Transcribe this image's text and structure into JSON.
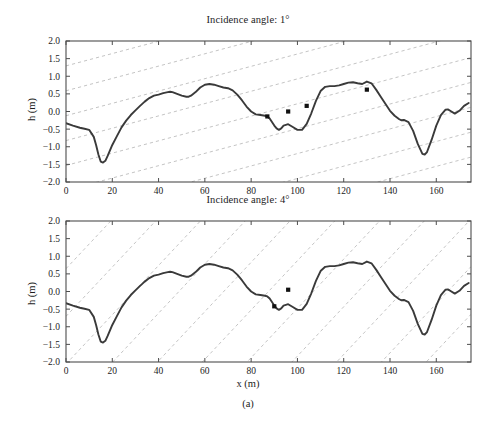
{
  "figure": {
    "subcaption": "(a)",
    "xlabel": "x (m)",
    "ylabel": "h (m)"
  },
  "style": {
    "curve_color": "#3a3a3a",
    "ray_color": "#bdbdbd",
    "axis_color": "#4d4d4d",
    "marker_color": "#111111",
    "background": "#ffffff"
  },
  "panels": [
    {
      "title": "Incidence angle: 1°"
    },
    {
      "title": "Incidence angle: 4°"
    }
  ],
  "chart_data": [
    {
      "type": "line",
      "title": "Incidence angle: 1°",
      "xlabel": "x (m)",
      "ylabel": "h (m)",
      "xlim": [
        0,
        175
      ],
      "ylim": [
        -2.0,
        2.0
      ],
      "xticks": [
        0,
        20,
        40,
        60,
        80,
        100,
        120,
        140,
        160
      ],
      "yticks": [
        -2.0,
        -1.5,
        -1.0,
        -0.5,
        0.0,
        0.5,
        1.0,
        1.5,
        2.0
      ],
      "ytick_labels": [
        "-2.0",
        "-1.5",
        "-1.0",
        "-0.5",
        "0.0",
        "0.5",
        "1.0",
        "1.5",
        "2.0"
      ],
      "grid": false,
      "series": [
        {
          "name": "terrain profile",
          "x": [
            0,
            3,
            6,
            8,
            10,
            12,
            13,
            14,
            15,
            16,
            17,
            18,
            20,
            22,
            24,
            26,
            28,
            30,
            32,
            34,
            36,
            38,
            40,
            42,
            44,
            45,
            46,
            48,
            50,
            52,
            53,
            54,
            56,
            58,
            60,
            62,
            64,
            66,
            68,
            70,
            72,
            74,
            76,
            78,
            80,
            82,
            84,
            86,
            87,
            88,
            90,
            91,
            92,
            93,
            94,
            96,
            98,
            100,
            102,
            104,
            106,
            108,
            110,
            112,
            114,
            116,
            118,
            120,
            122,
            124,
            126,
            128,
            130,
            132,
            134,
            136,
            138,
            140,
            142,
            144,
            145,
            146,
            148,
            150,
            152,
            154,
            155,
            156,
            158,
            160,
            162,
            164,
            165,
            166,
            168,
            170,
            172,
            174
          ],
          "y": [
            -0.33,
            -0.4,
            -0.46,
            -0.49,
            -0.52,
            -0.72,
            -0.95,
            -1.22,
            -1.42,
            -1.45,
            -1.4,
            -1.26,
            -0.95,
            -0.7,
            -0.45,
            -0.26,
            -0.1,
            0.03,
            0.16,
            0.28,
            0.38,
            0.45,
            0.48,
            0.52,
            0.55,
            0.56,
            0.55,
            0.5,
            0.45,
            0.42,
            0.42,
            0.45,
            0.55,
            0.68,
            0.76,
            0.78,
            0.76,
            0.72,
            0.68,
            0.66,
            0.6,
            0.48,
            0.32,
            0.14,
            0.0,
            -0.08,
            -0.1,
            -0.12,
            -0.14,
            -0.2,
            -0.4,
            -0.48,
            -0.52,
            -0.48,
            -0.4,
            -0.36,
            -0.44,
            -0.52,
            -0.52,
            -0.35,
            -0.05,
            0.3,
            0.58,
            0.7,
            0.72,
            0.72,
            0.74,
            0.78,
            0.82,
            0.83,
            0.8,
            0.78,
            0.85,
            0.8,
            0.62,
            0.42,
            0.22,
            0.02,
            -0.12,
            -0.22,
            -0.25,
            -0.24,
            -0.3,
            -0.55,
            -0.92,
            -1.2,
            -1.22,
            -1.15,
            -0.8,
            -0.4,
            -0.1,
            0.05,
            0.06,
            0.02,
            -0.06,
            0.02,
            0.16,
            0.24
          ]
        }
      ],
      "markers": [
        {
          "x": 87,
          "y": -0.14
        },
        {
          "x": 96,
          "y": 0.0
        },
        {
          "x": 104,
          "y": 0.16
        },
        {
          "x": 130,
          "y": 0.62
        }
      ],
      "rays": {
        "description": "family of parallel dashed incidence rays",
        "angle_deg": 1,
        "slope_rise_per_m": 0.0175,
        "count": 10,
        "style": "dashed"
      }
    },
    {
      "type": "line",
      "title": "Incidence angle: 4°",
      "xlabel": "x (m)",
      "ylabel": "h (m)",
      "xlim": [
        0,
        175
      ],
      "ylim": [
        -2.0,
        2.0
      ],
      "xticks": [
        0,
        20,
        40,
        60,
        80,
        100,
        120,
        140,
        160
      ],
      "yticks": [
        -2.0,
        -1.5,
        -1.0,
        -0.5,
        0.0,
        0.5,
        1.0,
        1.5,
        2.0
      ],
      "ytick_labels": [
        "-2.0",
        "-1.5",
        "-1.0",
        "-0.5",
        "0.0",
        "0.5",
        "1.0",
        "1.5",
        "2.0"
      ],
      "grid": false,
      "series": [
        {
          "name": "terrain profile",
          "x": [
            0,
            3,
            6,
            8,
            10,
            12,
            13,
            14,
            15,
            16,
            17,
            18,
            20,
            22,
            24,
            26,
            28,
            30,
            32,
            34,
            36,
            38,
            40,
            42,
            44,
            45,
            46,
            48,
            50,
            52,
            53,
            54,
            56,
            58,
            60,
            62,
            64,
            66,
            68,
            70,
            72,
            74,
            76,
            78,
            80,
            82,
            84,
            86,
            87,
            88,
            90,
            91,
            92,
            93,
            94,
            96,
            98,
            100,
            102,
            104,
            106,
            108,
            110,
            112,
            114,
            116,
            118,
            120,
            122,
            124,
            126,
            128,
            130,
            132,
            134,
            136,
            138,
            140,
            142,
            144,
            145,
            146,
            148,
            150,
            152,
            154,
            155,
            156,
            158,
            160,
            162,
            164,
            165,
            166,
            168,
            170,
            172,
            174
          ],
          "y": [
            -0.33,
            -0.4,
            -0.46,
            -0.49,
            -0.52,
            -0.72,
            -0.95,
            -1.22,
            -1.42,
            -1.45,
            -1.4,
            -1.26,
            -0.95,
            -0.7,
            -0.45,
            -0.26,
            -0.1,
            0.03,
            0.16,
            0.28,
            0.38,
            0.45,
            0.48,
            0.52,
            0.55,
            0.56,
            0.55,
            0.5,
            0.45,
            0.42,
            0.42,
            0.45,
            0.55,
            0.68,
            0.76,
            0.78,
            0.76,
            0.72,
            0.68,
            0.66,
            0.6,
            0.48,
            0.32,
            0.14,
            0.0,
            -0.08,
            -0.1,
            -0.12,
            -0.14,
            -0.2,
            -0.4,
            -0.48,
            -0.52,
            -0.48,
            -0.4,
            -0.36,
            -0.44,
            -0.52,
            -0.52,
            -0.35,
            -0.05,
            0.3,
            0.58,
            0.7,
            0.72,
            0.72,
            0.74,
            0.78,
            0.82,
            0.83,
            0.8,
            0.78,
            0.85,
            0.8,
            0.62,
            0.42,
            0.22,
            0.02,
            -0.12,
            -0.22,
            -0.25,
            -0.24,
            -0.3,
            -0.55,
            -0.92,
            -1.2,
            -1.22,
            -1.15,
            -0.8,
            -0.4,
            -0.1,
            0.05,
            0.06,
            0.02,
            -0.06,
            0.02,
            0.16,
            0.24
          ]
        }
      ],
      "markers": [
        {
          "x": 90,
          "y": -0.42
        },
        {
          "x": 96,
          "y": 0.05
        }
      ],
      "rays": {
        "description": "family of parallel dashed incidence rays",
        "angle_deg": 4,
        "slope_rise_per_m": 0.0699,
        "count": 12,
        "style": "dashed"
      }
    }
  ]
}
